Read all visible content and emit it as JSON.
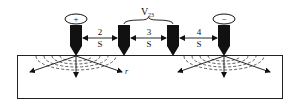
{
  "diagram": {
    "probes": [
      {
        "id": 1,
        "polarity": "+",
        "x": 76
      },
      {
        "id": 2,
        "polarity": "",
        "x": 124
      },
      {
        "id": 3,
        "polarity": "",
        "x": 173
      },
      {
        "id": 4,
        "polarity": "−",
        "x": 224
      }
    ],
    "voltage_label": "V",
    "voltage_subscript": "23",
    "spacings": [
      {
        "number": "2",
        "unit": "S"
      },
      {
        "number": "3",
        "unit": "S"
      },
      {
        "number": "4",
        "unit": "S"
      }
    ],
    "radial_label": "r",
    "colors": {
      "ink": "#111111",
      "background": "#ffffff"
    }
  }
}
